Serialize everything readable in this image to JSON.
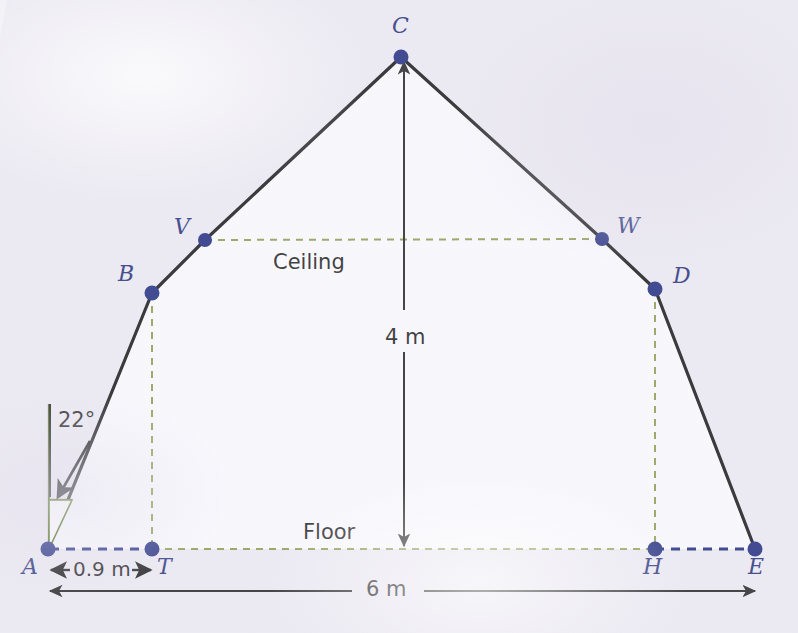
{
  "diagram": {
    "colors": {
      "outline": "#151515",
      "vertex": "#1e2a7d",
      "label": "#232f78",
      "ceiling_guide": "#8d9b4f",
      "floor_guide": "#8d9b4f",
      "base_dashed": "#1e2a7d",
      "angle_mark": "#4a6b16",
      "background": "#eceaf2",
      "interior": "#fcfcfe"
    },
    "vertices": [
      {
        "id": "A",
        "label": "A",
        "x": 48,
        "y": 549,
        "label_x": 22,
        "label_y": 558
      },
      {
        "id": "B",
        "label": "B",
        "x": 152,
        "y": 293,
        "label_x": 120,
        "label_y": 265
      },
      {
        "id": "V",
        "label": "V",
        "x": 205,
        "y": 240,
        "label_x": 174,
        "label_y": 218
      },
      {
        "id": "C",
        "label": "C",
        "x": 401,
        "y": 57,
        "label_x": 392,
        "label_y": 17
      },
      {
        "id": "W",
        "label": "W",
        "x": 602,
        "y": 239,
        "label_x": 619,
        "label_y": 217
      },
      {
        "id": "D",
        "label": "D",
        "x": 655,
        "y": 289,
        "label_x": 674,
        "label_y": 267
      },
      {
        "id": "E",
        "label": "E",
        "x": 755,
        "y": 549,
        "label_x": 748,
        "label_y": 558
      },
      {
        "id": "T",
        "label": "T",
        "x": 152,
        "y": 549,
        "label_x": 156,
        "label_y": 558
      },
      {
        "id": "H",
        "label": "H",
        "x": 655,
        "y": 549,
        "label_x": 645,
        "label_y": 558
      }
    ],
    "outline_path": "A-B-C-D-E",
    "region_labels": [
      {
        "name": "ceiling",
        "text": "Ceiling",
        "x": 273,
        "y": 252
      },
      {
        "name": "floor",
        "text": "Floor",
        "x": 303,
        "y": 522
      }
    ],
    "dimensions": [
      {
        "name": "height",
        "text": "4 m",
        "x": 385,
        "y": 327,
        "from": "C",
        "to": "floor"
      },
      {
        "name": "inset",
        "text": "0.9 m",
        "x": 75,
        "y": 560,
        "from": "A",
        "to": "T"
      },
      {
        "name": "base-width",
        "text": "6 m",
        "x": 368,
        "y": 578,
        "from": "A",
        "to": "E"
      }
    ],
    "angle": {
      "name": "roof-pitch-angle",
      "text": "22°",
      "value": 22,
      "unit": "degrees",
      "at_vertex": "A",
      "label_x": 58,
      "label_y": 410
    },
    "guides": [
      {
        "name": "ceiling-line",
        "style": "dashed",
        "color": "#8d9b4f",
        "from": "V",
        "to": "W"
      },
      {
        "name": "b-to-t-line",
        "style": "dashed",
        "color": "#8d9b4f",
        "from": "B",
        "to": "T"
      },
      {
        "name": "d-to-h-line",
        "style": "dashed",
        "color": "#8d9b4f",
        "from": "D",
        "to": "H"
      },
      {
        "name": "floor-line",
        "style": "dashed",
        "color": "#8d9b4f",
        "from": "T",
        "to": "H"
      },
      {
        "name": "a-to-t-line",
        "style": "dashed",
        "color": "#1e2a7d",
        "from": "A",
        "to": "T"
      },
      {
        "name": "h-to-e-line",
        "style": "dashed",
        "color": "#1e2a7d",
        "from": "H",
        "to": "E"
      }
    ]
  }
}
